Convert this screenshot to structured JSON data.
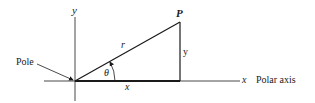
{
  "diagram": {
    "labels": {
      "y_axis": "y",
      "x_axis": "x",
      "point": "P",
      "radius": "r",
      "opposite_side": "y",
      "adjacent_side": "x",
      "angle": "θ",
      "pole": "Pole",
      "polar_axis": "Polar axis"
    },
    "colors": {
      "stroke": "#1a1a1a",
      "background": "#ffffff"
    }
  }
}
